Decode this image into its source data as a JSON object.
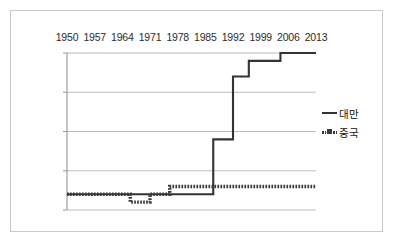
{
  "chart_data": {
    "type": "line",
    "title": "",
    "subtitle": "",
    "xlabel": "",
    "ylabel": "",
    "xlim": [
      1950,
      2013
    ],
    "ylim": [
      -10,
      10
    ],
    "yticks": [
      10,
      5,
      0,
      -5,
      -10
    ],
    "xticks": [
      1950,
      1957,
      1964,
      1971,
      1978,
      1985,
      1992,
      1999,
      2006,
      2013
    ],
    "xtick_labels": [
      "1950",
      "1957",
      "1964",
      "1971",
      "1978",
      "1985",
      "1992",
      "1999",
      "2006",
      "2013"
    ],
    "ytick_labels": [
      "10",
      "5",
      "0",
      "-5",
      "-10"
    ],
    "grid": true,
    "xaxis_position": "top",
    "legend_position": "right",
    "series": [
      {
        "name": "대만",
        "style": "solid",
        "color": "#333333",
        "x": [
          1950,
          1986,
          1987,
          1991,
          1992,
          1995,
          1996,
          2003,
          2004,
          2013
        ],
        "values": [
          -8,
          -8,
          -1,
          -1,
          7,
          7,
          9,
          9,
          10,
          10
        ]
      },
      {
        "name": "중국",
        "style": "dotted-square",
        "color": "#3a3a3a",
        "x": [
          1950,
          1965,
          1966,
          1970,
          1971,
          1975,
          1976,
          2013
        ],
        "values": [
          -8,
          -8,
          -9,
          -9,
          -8,
          -8,
          -7,
          -7
        ]
      }
    ]
  },
  "legend": {
    "items": [
      {
        "label": "대만",
        "marker": "solid-line",
        "color": "#333333"
      },
      {
        "label": "중국",
        "marker": "dotted-square-line",
        "color": "#3a3a3a"
      }
    ]
  }
}
